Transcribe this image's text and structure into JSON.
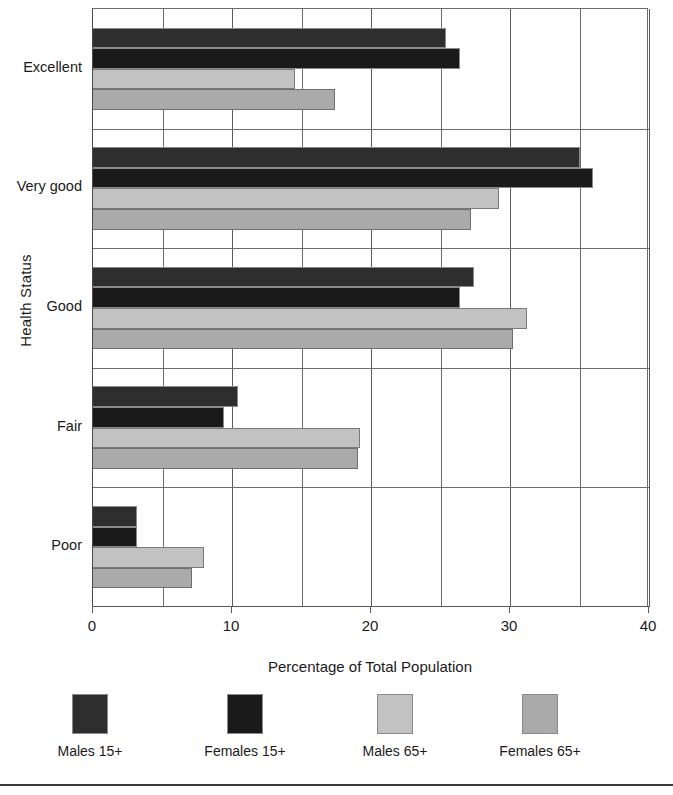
{
  "chart_data": {
    "type": "bar",
    "orientation": "horizontal",
    "title": "",
    "xlabel": "Percentage of Total Population",
    "ylabel": "Health Status",
    "categories": [
      "Excellent",
      "Very good",
      "Good",
      "Fair",
      "Poor"
    ],
    "xlim": [
      0,
      40
    ],
    "xticks": [
      0,
      10,
      20,
      30,
      40
    ],
    "xtick_labels": [
      "0",
      "10",
      "20",
      "30",
      "40"
    ],
    "minor_gridlines": [
      5,
      15,
      25,
      35
    ],
    "grid": true,
    "legend_position": "bottom",
    "series": [
      {
        "name": "Males 15+",
        "color": "#2e2e2e",
        "values": [
          25.4,
          35.0,
          27.4,
          10.4,
          3.2
        ]
      },
      {
        "name": "Females 15+",
        "color": "#1a1a1a",
        "values": [
          26.4,
          36.0,
          26.4,
          9.4,
          3.2
        ]
      },
      {
        "name": "Males 65+",
        "color": "#c2c2c2",
        "values": [
          14.5,
          29.2,
          31.2,
          19.2,
          8.0
        ]
      },
      {
        "name": "Females 65+",
        "color": "#aaaaaa",
        "values": [
          17.4,
          27.2,
          30.2,
          19.1,
          7.1
        ]
      }
    ]
  },
  "legend": {
    "items": [
      {
        "label": "Males 15+"
      },
      {
        "label": "Females 15+"
      },
      {
        "label": "Males 65+"
      },
      {
        "label": "Females 65+"
      }
    ]
  }
}
